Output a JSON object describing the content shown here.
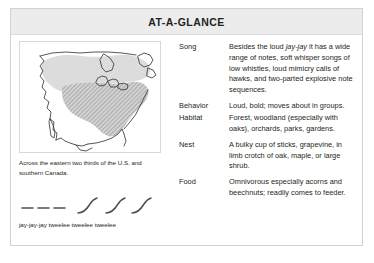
{
  "card": {
    "title": "AT-A-GLANCE"
  },
  "map": {
    "name": "range-map-north-america",
    "caption": "Across the eastern two thirds of the U.S. and southern Canada.",
    "legend": {
      "breeding_range_color": "#d9d9d9",
      "core_range_color": "#b8b8b8",
      "coastline_color": "#3a3a3a"
    }
  },
  "sonogram": {
    "name": "song-sonogram",
    "caption": "jay-jay-jay tweelee tweelee tweelee",
    "stroke_color": "#555555",
    "dashes": 3,
    "sweeps": 3
  },
  "facts": [
    {
      "label": "Song",
      "value_parts": [
        {
          "text": "Besides the loud ",
          "italic": false
        },
        {
          "text": "jay-jay",
          "italic": true
        },
        {
          "text": " it has a wide range of notes, soft whisper songs of low whistles, loud mimicry calls of hawks, and two-parted explosive note sequences.",
          "italic": false
        }
      ],
      "value": "Besides the loud jay-jay it has a wide range of notes, soft whisper songs of low whistles, loud mimicry calls of hawks, and two-parted explosive note sequences."
    },
    {
      "label": "Behavior",
      "value": "Loud, bold; moves about in groups."
    },
    {
      "label": "Habitat",
      "value": "Forest, woodland (especially with oaks), orchards, parks, gardens."
    },
    {
      "label": "Nest",
      "value": "A bulky cup of sticks, grapevine, in limb crotch of oak, maple, or large shrub."
    },
    {
      "label": "Food",
      "value": "Omnivorous especially acorns and beechnuts; readily comes to feeder."
    }
  ]
}
